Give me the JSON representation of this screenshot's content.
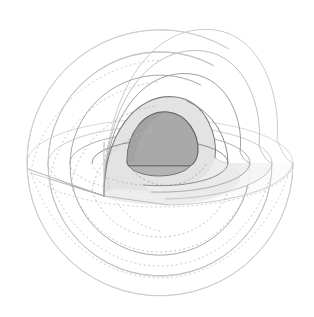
{
  "figure": {
    "kind": "cutaway-nested-spheres",
    "background_color": "#ffffff",
    "canvas": {
      "width": 314,
      "height": 317
    },
    "center": {
      "x": 160,
      "y": 163
    },
    "projection": {
      "type": "axonometric",
      "equator_ellipse_ratio": 0.33,
      "cut_apex": {
        "x": 104,
        "y": 196
      }
    },
    "stroke_colors": {
      "outer_faint": "#cfcfcf",
      "mid_light": "#bdbdbd",
      "mid": "#9a9a9a",
      "inner_dark": "#6f6f6f",
      "core_edge": "#5e5e5e",
      "hidden_dashed": "#b4b4b4"
    },
    "fill_colors": {
      "core": "#a9a9a9",
      "mantle": "#e3e3e3",
      "plane_light": "#ededed",
      "plane_lighter": "#f4f4f4",
      "shell_none": "none"
    },
    "shells": [
      {
        "index": 0,
        "name": "outermost-shell",
        "radius": 133,
        "stroke": "#cfcfcf",
        "stroke_width": 0.9,
        "fill": "none",
        "hidden_line": true
      },
      {
        "index": 1,
        "name": "outer-shell",
        "radius": 112,
        "stroke": "#c6c6c6",
        "stroke_width": 0.9,
        "fill": "none",
        "hidden_line": true
      },
      {
        "index": 2,
        "name": "upper-mantle-shell",
        "radius": 90,
        "stroke": "#aeaeae",
        "stroke_width": 1.0,
        "fill": "none",
        "hidden_line": true
      },
      {
        "index": 3,
        "name": "lower-mantle-shell",
        "radius": 68,
        "stroke": "#8d8d8d",
        "stroke_width": 1.0,
        "fill": "#e3e3e3",
        "hidden_line": true
      },
      {
        "index": 4,
        "name": "core-sphere",
        "radius": 47,
        "stroke": "#5e5e5e",
        "stroke_width": 1.1,
        "fill": "#a9a9a9",
        "hidden_line": false
      }
    ],
    "dashed_arcs": {
      "dash_pattern": "2,2.6",
      "count": 5,
      "note": "hidden far-side equatorial outlines of each shell"
    }
  }
}
